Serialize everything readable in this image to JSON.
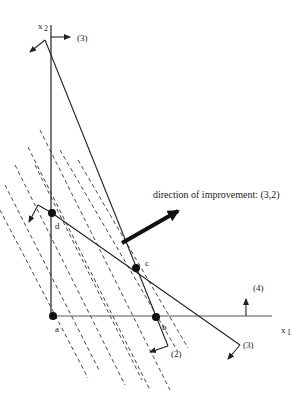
{
  "diagram": {
    "type": "linear-programming-feasible-region",
    "axes": {
      "x_label_main": "x",
      "x_label_sub": "1",
      "y_label_main": "x",
      "y_label_sub": "2"
    },
    "points": [
      {
        "id": "a",
        "label": "a",
        "x": 53,
        "y": 316
      },
      {
        "id": "b",
        "label": "b",
        "x": 156,
        "y": 317
      },
      {
        "id": "c",
        "label": "c",
        "x": 136,
        "y": 268
      },
      {
        "id": "d",
        "label": "d",
        "x": 52,
        "y": 213
      }
    ],
    "constraint_labels": {
      "top": "(3)",
      "right_arrow": "(4)",
      "bottom_b": "(2)",
      "bottom_right": "(3)"
    },
    "improvement": {
      "label": "direction of improvement: (3,2)"
    },
    "colors": {
      "line": "#222222",
      "background": "#ffffff"
    }
  }
}
